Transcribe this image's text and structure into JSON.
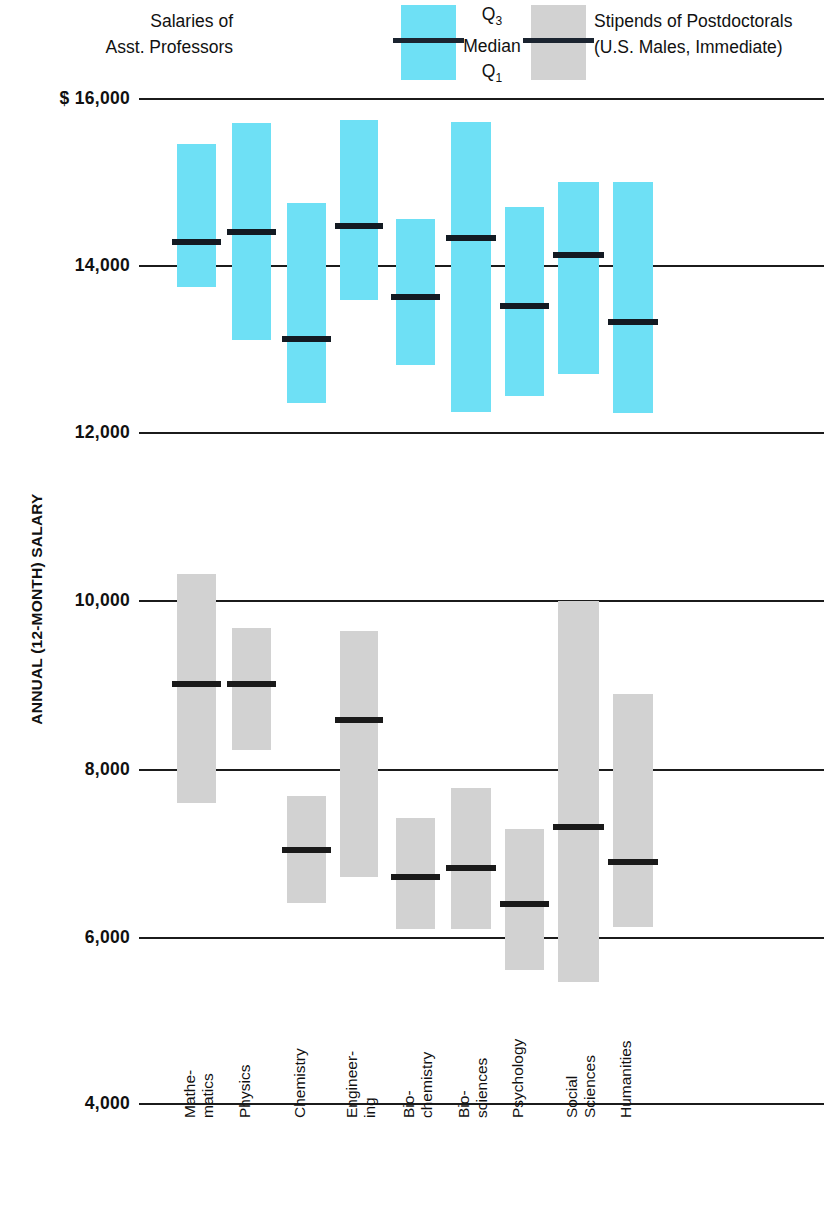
{
  "legend": {
    "left_label_line1": "Salaries of",
    "left_label_line2": "Asst. Professors",
    "middle_q3": "Q",
    "middle_q3_sub": "3",
    "middle_median": "Median",
    "middle_q1": "Q",
    "middle_q1_sub": "1",
    "right_label_line1": "Stipends of Postdoctorals",
    "right_label_line2": "(U.S. Males, Immediate)",
    "blue_color": "#6ee0f5",
    "gray_color": "#d2d2d2",
    "median_color": "#131a22"
  },
  "axis": {
    "y_title": "ANNUAL (12-MONTH) SALARY",
    "y_ticks": [
      "$ 16,000",
      "14,000",
      "12,000",
      "10,000",
      "8,000",
      "6,000",
      "4,000"
    ]
  },
  "chart_data": {
    "type": "bar",
    "title": "",
    "subtitle": "",
    "xlabel": "",
    "ylabel": "ANNUAL (12-MONTH) SALARY",
    "ylim": [
      4000,
      16000
    ],
    "yticks": [
      4000,
      6000,
      8000,
      10000,
      12000,
      14000,
      16000
    ],
    "ytick_labels": [
      "4,000",
      "6,000",
      "8,000",
      "10,000",
      "12,000",
      "14,000",
      "$ 16,000"
    ],
    "grid": true,
    "legend_position": "top",
    "categories": [
      "Mathe-\nmatics",
      "Physics",
      "Chemistry",
      "Engineer-\ning",
      "Bio-\nchemistry",
      "Bio-\nsciences",
      "Psychology",
      "Social\nSciences",
      "Humanities"
    ],
    "series": [
      {
        "name": "Salaries of Asst. Professors",
        "color": "#6ee0f5",
        "stat": "box (Q1, Median, Q3)",
        "q3": [
          15450,
          15700,
          14750,
          15740,
          14550,
          15710,
          14700,
          15000,
          15000
        ],
        "median": [
          14280,
          14400,
          13120,
          14470,
          13620,
          14330,
          13520,
          14120,
          13320
        ],
        "q1": [
          13740,
          13110,
          12360,
          13590,
          12810,
          12250,
          12440,
          12700,
          12240
        ]
      },
      {
        "name": "Stipends of Postdoctorals (U.S. Males, Immediate)",
        "color": "#d2d2d2",
        "stat": "box (Q1, Median, Q3)",
        "q3": [
          10320,
          9670,
          7670,
          9640,
          7400,
          7760,
          7270,
          10000,
          8880
        ],
        "median": [
          9000,
          9000,
          7020,
          8570,
          6700,
          6810,
          6380,
          7300,
          6880
        ],
        "q1": [
          7580,
          8220,
          6390,
          6700,
          6080,
          6080,
          5590,
          5440,
          6100
        ]
      }
    ]
  }
}
